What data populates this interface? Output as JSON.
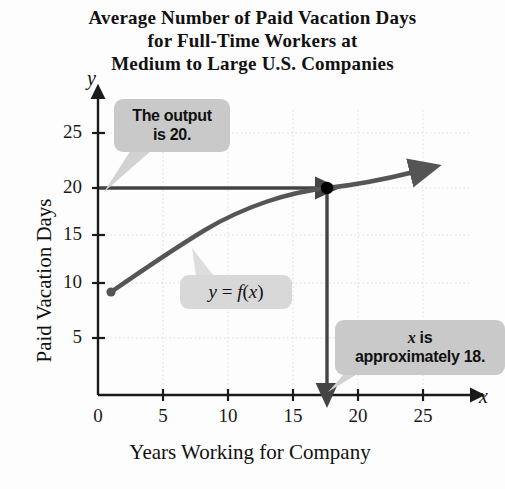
{
  "title": {
    "line1": "Average Number of Paid Vacation Days",
    "line2": "for Full-Time Workers at",
    "line3": "Medium to Large U.S. Companies"
  },
  "axes": {
    "y_axis_symbol": "y",
    "x_axis_symbol": "x",
    "y_axis_title": "Paid Vacation Days",
    "x_axis_title": "Years Working for Company"
  },
  "annotations": {
    "output_callout_line1": "The output",
    "output_callout_line2": "is 20.",
    "function_label": "y = f(x)",
    "x_callout_line1": "x is",
    "x_callout_line2": "approximately 18."
  },
  "colors": {
    "curve": "#555555",
    "guide_line": "#444444",
    "point": "#000000",
    "callout_bg": "#c9c9c9",
    "grid": "#dcdcdc",
    "axis": "#1a1a1a",
    "background": "#fdfdfd"
  },
  "chart_data": {
    "type": "line",
    "title": "Average Number of Paid Vacation Days for Full-Time Workers at Medium to Large U.S. Companies",
    "xlabel": "Years Working for Company",
    "ylabel": "Paid Vacation Days",
    "xlim": [
      0,
      26
    ],
    "ylim": [
      0,
      27
    ],
    "xticks": [
      0,
      5,
      10,
      15,
      20,
      25
    ],
    "yticks": [
      5,
      10,
      15,
      20,
      25
    ],
    "grid": true,
    "legend": "none",
    "series": [
      {
        "name": "y = f(x)",
        "x": [
          1,
          3,
          5,
          7,
          10,
          13,
          15,
          18,
          21,
          25
        ],
        "values": [
          9.5,
          11.5,
          13.1,
          14.4,
          16.3,
          17.8,
          18.8,
          20.0,
          20.9,
          22.0
        ]
      }
    ],
    "highlight_point": {
      "x": 18,
      "y": 20,
      "label": "(18, 20)"
    },
    "guides": [
      {
        "type": "horizontal",
        "y": 20,
        "from_x": 0,
        "to_x": 18,
        "arrow": true
      },
      {
        "type": "vertical",
        "x": 18,
        "from_y": 20,
        "to_y": 0,
        "arrow": true
      }
    ],
    "annotations": [
      {
        "text": "The output is 20.",
        "points_to": {
          "x": 0,
          "y": 20
        }
      },
      {
        "text": "y = f(x)",
        "points_to": {
          "x": 8.5,
          "y": 15.6
        }
      },
      {
        "text": "x is approximately 18.",
        "points_to": {
          "x": 18,
          "y": 0
        }
      }
    ]
  }
}
